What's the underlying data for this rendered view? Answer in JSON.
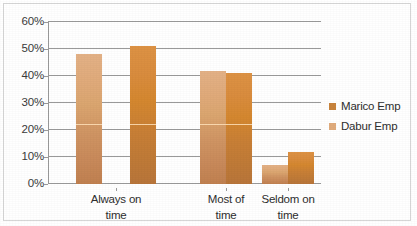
{
  "chart_data": {
    "type": "bar",
    "title": "",
    "subtitle": "",
    "xlabel": "",
    "ylabel": "",
    "categories": [
      "Always on time",
      "Most of time",
      "Seldom on time"
    ],
    "category_lines": [
      [
        "Always on",
        "time"
      ],
      [
        "Most of",
        "time"
      ],
      [
        "Seldom on",
        "time"
      ]
    ],
    "series": [
      {
        "name": "Marico Emp",
        "color": "#c9handled",
        "values": [
          48,
          42,
          7
        ]
      },
      {
        "name": "Dabur Emp",
        "color": "#d4872f",
        "values": [
          51,
          41,
          12
        ]
      }
    ],
    "ylim": [
      0,
      60
    ],
    "ytick_values": [
      0,
      10,
      20,
      30,
      40,
      50,
      60
    ],
    "ytick_labels": [
      "0%",
      "10%",
      "20%",
      "30%",
      "40%",
      "50%",
      "60%"
    ],
    "grid": true,
    "grid_axis": "y",
    "legend_position": "right",
    "colors": {
      "series_0": "#d8a070",
      "series_1": "#d4872f",
      "gridline": "#9a9a9a",
      "axis": "#9a9a9a",
      "text": "#2e2e2e",
      "border": "#d6d6d6",
      "background": "#ffffff"
    }
  },
  "legend": {
    "items": [
      {
        "label": "Marico Emp",
        "swatch": "#c8833c"
      },
      {
        "label": "Dabur Emp",
        "swatch": "#e0ab7c"
      }
    ]
  }
}
